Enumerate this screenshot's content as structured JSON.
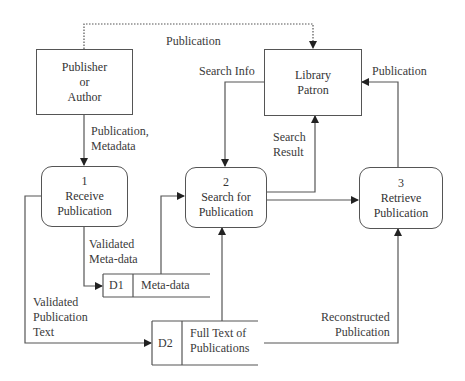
{
  "diagram": {
    "type": "data-flow-diagram",
    "external_entities": [
      {
        "id": "publisher",
        "lines": [
          "Publisher",
          "or",
          "Author"
        ]
      },
      {
        "id": "patron",
        "lines": [
          "Library",
          "Patron"
        ]
      }
    ],
    "processes": [
      {
        "number": "1",
        "lines": [
          "Receive",
          "Publication"
        ]
      },
      {
        "number": "2",
        "lines": [
          "Search for",
          "Publication"
        ]
      },
      {
        "number": "3",
        "lines": [
          "Retrieve",
          "Publication"
        ]
      }
    ],
    "data_stores": [
      {
        "id": "D1",
        "name": "Meta-data"
      },
      {
        "id": "D2",
        "lines": [
          "Full Text of",
          "Publications"
        ]
      }
    ],
    "flows": {
      "publisher_to_patron": "Publication",
      "publisher_to_receive": [
        "Publication,",
        "Metadata"
      ],
      "patron_to_search": "Search Info",
      "search_to_patron": [
        "Search",
        "Result"
      ],
      "retrieve_to_patron": "Publication",
      "receive_to_d1": [
        "Validated",
        "Meta-data"
      ],
      "receive_to_d2": [
        "Validated",
        "Publication",
        "Text"
      ],
      "d2_to_retrieve": [
        "Reconstructed",
        "Publication"
      ]
    }
  }
}
